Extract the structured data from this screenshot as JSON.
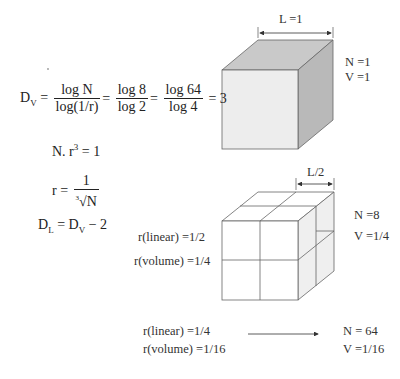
{
  "formulas": {
    "dv": {
      "lhs": "D",
      "lhs_sub": "V",
      "f1_num": "log N",
      "f1_den": "log(1/r)",
      "f2_num": "log 8",
      "f2_den": "log 2",
      "f3_num": "log 64",
      "f3_den": "log 4",
      "result": "= 3"
    },
    "nr": {
      "text": "N. r",
      "exp": "3",
      "rhs": " = 1"
    },
    "r": {
      "lhs": "r = ",
      "num": "1",
      "den_index": "3",
      "den": "√N"
    },
    "dl": {
      "lhs": "D",
      "lhs_sub": "L",
      "mid": " = D",
      "mid_sub": "V",
      "rhs": " − 2"
    }
  },
  "cube1": {
    "dimension_label": "L =1",
    "n_label": "N =1",
    "v_label": "V =1"
  },
  "cube2": {
    "dimension_label": "L/2",
    "n_label": "N =8",
    "v_label": "V =1/4",
    "r_linear": "r(linear) =1/2",
    "r_volume": "r(volume) =1/4"
  },
  "step3": {
    "r_linear": "r(linear) =1/4",
    "r_volume": "r(volume) =1/16",
    "n_label": "N = 64",
    "v_label": "V =1/16"
  },
  "colors": {
    "cube_front": "#ececec",
    "cube_top": "#c8c8c8",
    "cube_side": "#b8b8b8",
    "line": "#555555"
  }
}
